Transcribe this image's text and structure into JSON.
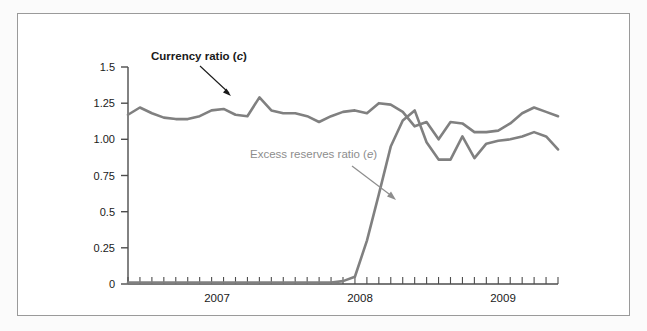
{
  "figure": {
    "background_color": "#ffffff",
    "frame_color": "#9a9a9a"
  },
  "chart_data": {
    "type": "line",
    "title": "",
    "subtitle": "",
    "xlabel": "",
    "ylabel": "",
    "grid": false,
    "legend_position": "inline-annotation",
    "xlim": [
      2006.5,
      2009.5
    ],
    "ylim": [
      0,
      1.5
    ],
    "yticks": [
      0,
      0.25,
      0.5,
      0.75,
      1.0,
      1.25,
      1.5
    ],
    "ytick_labels": [
      "0",
      "0.25",
      "0.5",
      "0.75",
      "1.00",
      "1.25",
      "1.5"
    ],
    "xtick_labels": [
      "2007",
      "2008",
      "2009"
    ],
    "xtick_label_positions": [
      2007.0,
      2008.0,
      2009.0
    ],
    "xtick_interval_months": 1,
    "series": [
      {
        "name": "Currency ratio (c)",
        "symbol": "c",
        "color": "#808080",
        "label_color": "#1a1a1a",
        "label_bold": true,
        "x": [
          2006.5,
          2006.583,
          2006.667,
          2006.75,
          2006.833,
          2006.917,
          2007.0,
          2007.083,
          2007.167,
          2007.25,
          2007.333,
          2007.417,
          2007.5,
          2007.583,
          2007.667,
          2007.75,
          2007.833,
          2007.917,
          2008.0,
          2008.083,
          2008.167,
          2008.25,
          2008.333,
          2008.417,
          2008.5,
          2008.583,
          2008.667,
          2008.75,
          2008.833,
          2008.917,
          2009.0,
          2009.083,
          2009.167,
          2009.25,
          2009.333,
          2009.417,
          2009.5
        ],
        "values": [
          1.17,
          1.22,
          1.18,
          1.15,
          1.14,
          1.14,
          1.16,
          1.2,
          1.21,
          1.17,
          1.16,
          1.29,
          1.2,
          1.18,
          1.18,
          1.16,
          1.12,
          1.16,
          1.19,
          1.2,
          1.18,
          1.25,
          1.24,
          1.19,
          1.09,
          1.12,
          1.0,
          1.12,
          1.11,
          1.05,
          1.05,
          1.06,
          1.11,
          1.18,
          1.22,
          1.19,
          1.16
        ]
      },
      {
        "name": "Excess reserves ratio (e)",
        "symbol": "e",
        "color": "#808080",
        "label_color": "#8d8d8d",
        "label_bold": false,
        "x": [
          2006.5,
          2006.583,
          2006.667,
          2006.75,
          2006.833,
          2006.917,
          2007.0,
          2007.083,
          2007.167,
          2007.25,
          2007.333,
          2007.417,
          2007.5,
          2007.583,
          2007.667,
          2007.75,
          2007.833,
          2007.917,
          2008.0,
          2008.083,
          2008.167,
          2008.25,
          2008.333,
          2008.417,
          2008.5,
          2008.583,
          2008.667,
          2008.75,
          2008.833,
          2008.917,
          2009.0,
          2009.083,
          2009.167,
          2009.25,
          2009.333,
          2009.417,
          2009.5
        ],
        "values": [
          0.01,
          0.01,
          0.01,
          0.01,
          0.01,
          0.01,
          0.01,
          0.01,
          0.01,
          0.01,
          0.01,
          0.01,
          0.01,
          0.01,
          0.01,
          0.01,
          0.01,
          0.01,
          0.02,
          0.05,
          0.3,
          0.62,
          0.95,
          1.13,
          1.2,
          0.98,
          0.86,
          0.86,
          1.02,
          0.87,
          0.97,
          0.99,
          1.0,
          1.02,
          1.05,
          1.02,
          0.93
        ]
      }
    ],
    "annotations": [
      {
        "id": "currency-ratio-annotation",
        "text_prefix": "Currency ratio (",
        "text_symbol": "c",
        "text_suffix": ")",
        "color": "#1a1a1a",
        "bold": true,
        "arrow_color": "#1a1a1a"
      },
      {
        "id": "excess-reserves-annotation",
        "text_prefix": "Excess reserves ratio (",
        "text_symbol": "e",
        "text_suffix": ")",
        "color": "#8d8d8d",
        "bold": false,
        "arrow_color": "#8d8d8d"
      }
    ]
  }
}
